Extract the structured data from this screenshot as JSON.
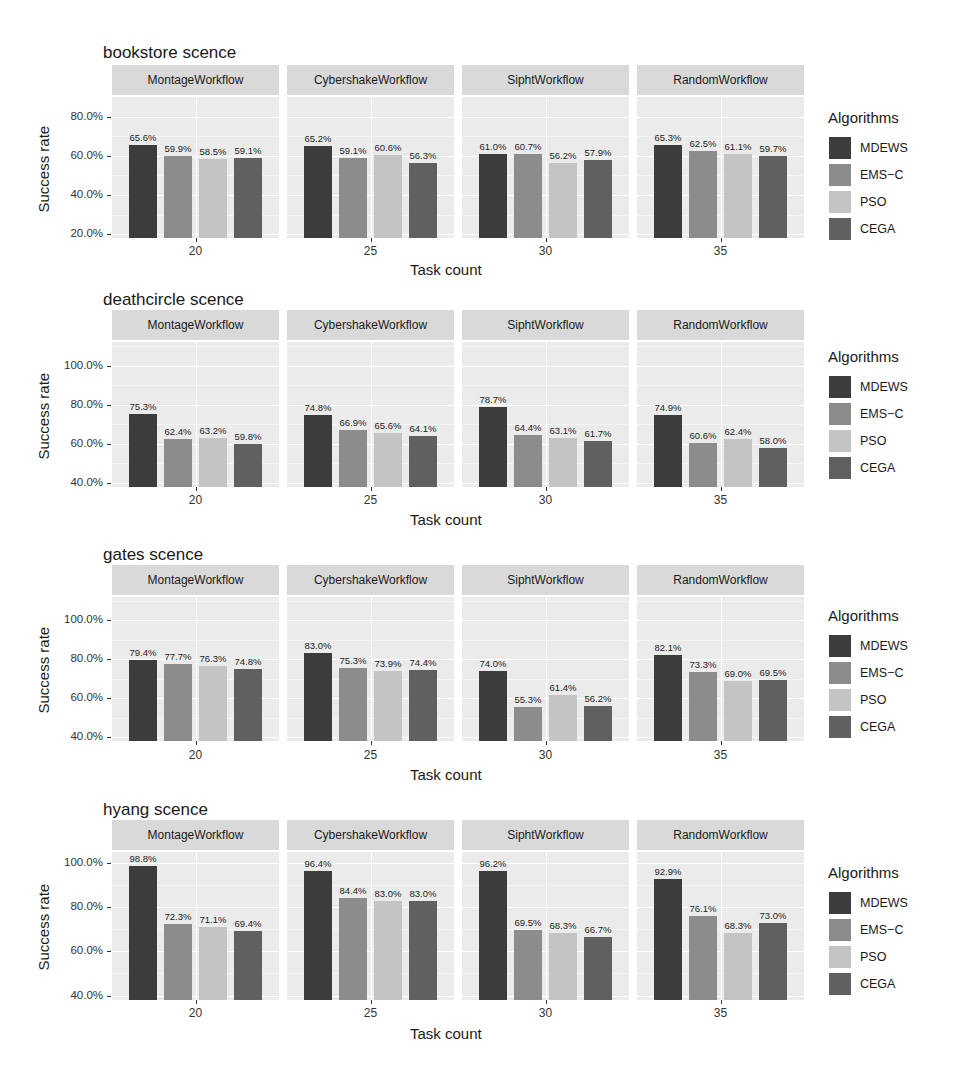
{
  "legend": {
    "title": "Algorithms",
    "items": [
      {
        "name": "MDEWS",
        "color": "#3c3c3c"
      },
      {
        "name": "EMS−C",
        "color": "#8c8c8c"
      },
      {
        "name": "PSO",
        "color": "#c4c4c4"
      },
      {
        "name": "CEGA",
        "color": "#606060"
      }
    ]
  },
  "axis": {
    "xlabel": "Task count",
    "ylabel": "Success rate"
  },
  "chart_data": [
    {
      "type": "bar",
      "title": "bookstore scence",
      "xlabel": "Task count",
      "ylabel": "Success rate",
      "facets": [
        "MontageWorkflow",
        "CybershakeWorkflow",
        "SiphtWorkflow",
        "RandomWorkflow"
      ],
      "categories": [
        "20",
        "25",
        "30",
        "35"
      ],
      "yticks": [
        "20.0%",
        "40.0%",
        "60.0%",
        "80.0%"
      ],
      "ylim": [
        18,
        90
      ],
      "series": [
        {
          "name": "MDEWS",
          "values": [
            65.6,
            65.2,
            61.0,
            65.3
          ]
        },
        {
          "name": "EMS-C",
          "values": [
            59.9,
            59.1,
            60.7,
            62.5
          ]
        },
        {
          "name": "PSO",
          "values": [
            58.5,
            60.6,
            56.2,
            61.1
          ]
        },
        {
          "name": "CEGA",
          "values": [
            59.1,
            56.3,
            57.9,
            59.7
          ]
        }
      ],
      "labels": [
        [
          "65.6%",
          "59.9%",
          "58.5%",
          "59.1%"
        ],
        [
          "65.2%",
          "59.1%",
          "60.6%",
          "56.3%"
        ],
        [
          "61.0%",
          "60.7%",
          "56.2%",
          "57.9%"
        ],
        [
          "65.3%",
          "62.5%",
          "61.1%",
          "59.7%"
        ]
      ],
      "grid": true,
      "legend_position": "right"
    },
    {
      "type": "bar",
      "title": "deathcircle scence",
      "xlabel": "Task count",
      "ylabel": "Success rate",
      "facets": [
        "MontageWorkflow",
        "CybershakeWorkflow",
        "SiphtWorkflow",
        "RandomWorkflow"
      ],
      "categories": [
        "20",
        "25",
        "30",
        "35"
      ],
      "yticks": [
        "40.0%",
        "60.0%",
        "80.0%",
        "100.0%"
      ],
      "ylim": [
        38,
        112
      ],
      "series": [
        {
          "name": "MDEWS",
          "values": [
            75.3,
            74.8,
            78.7,
            74.9
          ]
        },
        {
          "name": "EMS-C",
          "values": [
            62.4,
            66.9,
            64.4,
            60.6
          ]
        },
        {
          "name": "PSO",
          "values": [
            63.2,
            65.6,
            63.1,
            62.4
          ]
        },
        {
          "name": "CEGA",
          "values": [
            59.8,
            64.1,
            61.7,
            58.0
          ]
        }
      ],
      "labels": [
        [
          "75.3%",
          "62.4%",
          "63.2%",
          "59.8%"
        ],
        [
          "74.8%",
          "66.9%",
          "65.6%",
          "64.1%"
        ],
        [
          "78.7%",
          "64.4%",
          "63.1%",
          "61.7%"
        ],
        [
          "74.9%",
          "60.6%",
          "62.4%",
          "58.0%"
        ]
      ],
      "grid": true,
      "legend_position": "right"
    },
    {
      "type": "bar",
      "title": "gates scence",
      "xlabel": "Task count",
      "ylabel": "Success rate",
      "facets": [
        "MontageWorkflow",
        "CybershakeWorkflow",
        "SiphtWorkflow",
        "RandomWorkflow"
      ],
      "categories": [
        "20",
        "25",
        "30",
        "35"
      ],
      "yticks": [
        "40.0%",
        "60.0%",
        "80.0%",
        "100.0%"
      ],
      "ylim": [
        38,
        112
      ],
      "series": [
        {
          "name": "MDEWS",
          "values": [
            79.4,
            83.0,
            74.0,
            82.1
          ]
        },
        {
          "name": "EMS-C",
          "values": [
            77.7,
            75.3,
            55.3,
            73.3
          ]
        },
        {
          "name": "PSO",
          "values": [
            76.3,
            73.9,
            61.4,
            69.0
          ]
        },
        {
          "name": "CEGA",
          "values": [
            74.8,
            74.4,
            56.2,
            69.5
          ]
        }
      ],
      "labels": [
        [
          "79.4%",
          "77.7%",
          "76.3%",
          "74.8%"
        ],
        [
          "83.0%",
          "75.3%",
          "73.9%",
          "74.4%"
        ],
        [
          "74.0%",
          "55.3%",
          "61.4%",
          "56.2%"
        ],
        [
          "82.1%",
          "73.3%",
          "69.0%",
          "69.5%"
        ]
      ],
      "grid": true,
      "legend_position": "right"
    },
    {
      "type": "bar",
      "title": "hyang scence",
      "xlabel": "Task count",
      "ylabel": "Success rate",
      "facets": [
        "MontageWorkflow",
        "CybershakeWorkflow",
        "SiphtWorkflow",
        "RandomWorkflow"
      ],
      "categories": [
        "20",
        "25",
        "30",
        "35"
      ],
      "yticks": [
        "40.0%",
        "60.0%",
        "80.0%",
        "100.0%"
      ],
      "ylim": [
        38,
        105
      ],
      "series": [
        {
          "name": "MDEWS",
          "values": [
            98.8,
            96.4,
            96.2,
            92.9
          ]
        },
        {
          "name": "EMS-C",
          "values": [
            72.3,
            84.4,
            69.5,
            76.1
          ]
        },
        {
          "name": "PSO",
          "values": [
            71.1,
            83.0,
            68.3,
            68.3
          ]
        },
        {
          "name": "CEGA",
          "values": [
            69.4,
            83.0,
            66.7,
            73.0
          ]
        }
      ],
      "labels": [
        [
          "98.8%",
          "72.3%",
          "71.1%",
          "69.4%"
        ],
        [
          "96.4%",
          "84.4%",
          "83.0%",
          "83.0%"
        ],
        [
          "96.2%",
          "69.5%",
          "68.3%",
          "66.7%"
        ],
        [
          "92.9%",
          "76.1%",
          "68.3%",
          "73.0%"
        ]
      ],
      "grid": true,
      "legend_position": "right"
    }
  ]
}
